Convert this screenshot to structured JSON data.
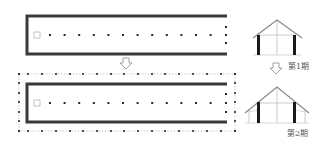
{
  "colors": {
    "wall": "#3a3a3a",
    "post": "#2a2a2a",
    "light_line": "#bdbdbd",
    "roof": "#8a8a8a",
    "text": "#555555",
    "arrow": "#8a8a8a"
  },
  "plans": [
    {
      "id": "phase1-plan",
      "wall_rect": {
        "x": 27,
        "y": 16,
        "w": 200,
        "h": 38
      },
      "square": {
        "x": 34,
        "y": 32,
        "size": 6
      },
      "center_row": {
        "y": 35,
        "x_start": 50,
        "spacing": 14.6,
        "count": 12
      },
      "end_posts": {
        "x": 226,
        "ys": [
          27,
          35,
          43
        ]
      }
    },
    {
      "id": "phase2-plan",
      "outer_rect": {
        "x": 19,
        "y": 74,
        "w": 216,
        "h": 57
      },
      "outer_row_xs": [
        19,
        28,
        42,
        56,
        70,
        83,
        97,
        111,
        124,
        138,
        152,
        165,
        179,
        193,
        207,
        221,
        235
      ],
      "outer_col_ys": [
        74,
        83,
        93,
        102,
        112,
        121,
        131
      ],
      "wall_rect": {
        "x": 27,
        "y": 84,
        "w": 200,
        "h": 38
      },
      "square": {
        "x": 34,
        "y": 100,
        "size": 6
      },
      "center_row": {
        "y": 103,
        "x_start": 50,
        "spacing": 14.6,
        "count": 12
      },
      "end_posts": {
        "x": 226,
        "ys": [
          94,
          103,
          112
        ]
      }
    }
  ],
  "arrows": [
    {
      "id": "plan-arrow",
      "cx": 126,
      "y": 58
    },
    {
      "id": "section-arrow",
      "cx": 276,
      "y": 63
    }
  ],
  "sections": [
    {
      "id": "phase1-section",
      "label": "第1期",
      "label_x": 288,
      "label_y": 60
    },
    {
      "id": "phase2-section",
      "label": "第2期",
      "label_x": 287,
      "label_y": 127
    }
  ]
}
